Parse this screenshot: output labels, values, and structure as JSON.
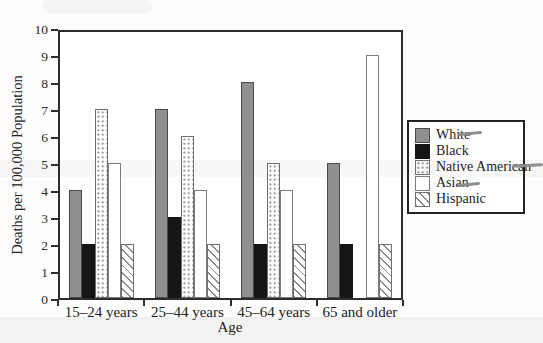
{
  "background": "#fdfdfd",
  "colors": {
    "axis": "#2d2d2d",
    "bar_gray": "#8f8f8f",
    "bar_black": "#151515",
    "pattern_gray": "#9a9a9a",
    "legend_border": "#222222",
    "pencil_mark": "#8e8e8e"
  },
  "chart_data": {
    "type": "bar",
    "categories": [
      "15–24 years",
      "25–44 years",
      "45–64 years",
      "65 and older"
    ],
    "series": [
      {
        "name": "White",
        "fill": "solid-gray",
        "values": [
          4,
          7,
          8,
          5
        ]
      },
      {
        "name": "Black",
        "fill": "solid-black",
        "values": [
          2,
          3,
          2,
          2
        ]
      },
      {
        "name": "Native American",
        "fill": "dots",
        "values": [
          7,
          6,
          5,
          null
        ]
      },
      {
        "name": "Asian",
        "fill": "plain",
        "values": [
          5,
          4,
          4,
          9
        ]
      },
      {
        "name": "Hispanic",
        "fill": "hatch",
        "values": [
          2,
          2,
          2,
          2
        ]
      }
    ],
    "xlabel": "Age",
    "ylabel": "Deaths per 100,000 Population",
    "ylim": [
      0,
      10
    ],
    "ytick_step": 1,
    "grid": false,
    "legend_position": "right"
  },
  "annotations": [
    {
      "id": "white",
      "target": "White legend entry",
      "style": "pencil-dash"
    },
    {
      "id": "native-american",
      "target": "Native American legend entry",
      "style": "pencil-dash"
    },
    {
      "id": "asian",
      "target": "Asian legend entry",
      "style": "pencil-dash"
    }
  ]
}
